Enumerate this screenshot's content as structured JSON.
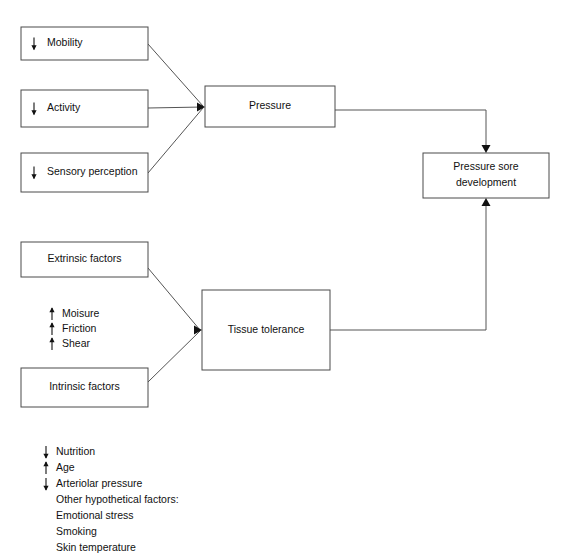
{
  "diagram": {
    "background_color": "#ffffff",
    "line_color": "#555555",
    "text_color": "#111111",
    "nodes": [
      {
        "id": "mobility",
        "label": "Mobility",
        "trend": "down",
        "x": 21,
        "y": 27,
        "w": 127,
        "h": 33,
        "align": "left-arrow"
      },
      {
        "id": "activity",
        "label": "Activity",
        "trend": "down",
        "x": 21,
        "y": 90,
        "w": 127,
        "h": 37,
        "align": "left-arrow"
      },
      {
        "id": "sensory-perception",
        "label": "Sensory perception",
        "trend": "down",
        "x": 21,
        "y": 153,
        "w": 127,
        "h": 39,
        "align": "left-arrow"
      },
      {
        "id": "pressure",
        "label": "Pressure",
        "trend": "none",
        "x": 205,
        "y": 86,
        "w": 130,
        "h": 41,
        "align": "center"
      },
      {
        "id": "pressure-sore-development",
        "label": "Pressure sore\ndevelopment",
        "label_line1": "Pressure sore",
        "label_line2": "development",
        "trend": "none",
        "x": 423,
        "y": 153,
        "w": 126,
        "h": 45,
        "align": "center"
      },
      {
        "id": "extrinsic-factors",
        "label": "Extrinsic factors",
        "trend": "none",
        "x": 21,
        "y": 242,
        "w": 127,
        "h": 35,
        "align": "center"
      },
      {
        "id": "intrinsic-factors",
        "label": "Intrinsic factors",
        "trend": "none",
        "x": 21,
        "y": 368,
        "w": 127,
        "h": 39,
        "align": "center"
      },
      {
        "id": "tissue-tolerance",
        "label": "Tissue tolerance",
        "trend": "none",
        "x": 202,
        "y": 290,
        "w": 128,
        "h": 80,
        "align": "center"
      }
    ],
    "extrinsic_list": {
      "x": 48,
      "y": 314,
      "line_height": 15,
      "items": [
        {
          "trend": "up",
          "label": "Moisure"
        },
        {
          "trend": "up",
          "label": "Friction"
        },
        {
          "trend": "up",
          "label": "Shear"
        }
      ]
    },
    "intrinsic_list": {
      "x": 42,
      "y": 452,
      "line_height": 16,
      "items": [
        {
          "trend": "down",
          "label": "Nutrition"
        },
        {
          "trend": "up",
          "label": "Age"
        },
        {
          "trend": "down",
          "label": "Arteriolar pressure"
        },
        {
          "trend": "none",
          "label": "Other hypothetical factors:"
        },
        {
          "trend": "none",
          "label": "Emotional stress"
        },
        {
          "trend": "none",
          "label": "Smoking"
        },
        {
          "trend": "none",
          "label": "Skin temperature"
        }
      ]
    },
    "connectors": [
      {
        "id": "mobility-to-pressure",
        "from": "mobility",
        "to": "pressure",
        "path": "M148,44 L203,106",
        "arrow": "none"
      },
      {
        "id": "activity-to-pressure",
        "from": "activity",
        "to": "pressure",
        "path": "M148,108 L203,107",
        "arrow": "none"
      },
      {
        "id": "sensory-to-pressure",
        "from": "sensory-perception",
        "to": "pressure",
        "path": "M148,173 L203,108",
        "arrow": "none"
      },
      {
        "id": "pressure-to-sore",
        "from": "pressure",
        "to": "pressure-sore-development",
        "path": "M335,110 L486,110 L486,148",
        "arrow": "down"
      },
      {
        "id": "extrinsic-to-tissue",
        "from": "extrinsic-factors",
        "to": "tissue-tolerance",
        "path": "M148,268 L200,330",
        "arrow": "none"
      },
      {
        "id": "intrinsic-to-tissue",
        "from": "intrinsic-factors",
        "to": "tissue-tolerance",
        "path": "M148,382 L200,331",
        "arrow": "none"
      },
      {
        "id": "tissue-to-sore",
        "from": "tissue-tolerance",
        "to": "pressure-sore-development",
        "path": "M330,330 L486,330 L486,203",
        "arrow": "up"
      }
    ],
    "arrow_markers": [
      {
        "id": "arrowhead-pressure-inlet",
        "kind": "right",
        "x": 205,
        "y": 107
      },
      {
        "id": "arrowhead-tissue-inlet",
        "kind": "right",
        "x": 202,
        "y": 330
      },
      {
        "id": "arrowhead-sore-top",
        "kind": "down",
        "x": 486,
        "y": 153
      },
      {
        "id": "arrowhead-sore-bottom",
        "kind": "up",
        "x": 486,
        "y": 198
      }
    ]
  }
}
